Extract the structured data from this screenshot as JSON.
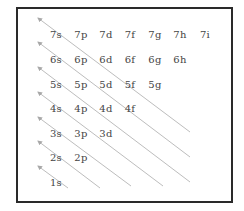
{
  "diagram": {
    "rows": [
      [
        "7s",
        "7p",
        "7d",
        "7f",
        "7g",
        "7h",
        "7i"
      ],
      [
        "6s",
        "6p",
        "6d",
        "6f",
        "6g",
        "6h"
      ],
      [
        "5s",
        "5p",
        "5d",
        "5f",
        "5g"
      ],
      [
        "4s",
        "4p",
        "4d",
        "4f"
      ],
      [
        "3s",
        "3p",
        "3d"
      ],
      [
        "2s",
        "2p"
      ],
      [
        "1s"
      ]
    ],
    "arrow_count": 7,
    "colors": {
      "border": "#2a2a2a",
      "text": "#444444",
      "arrow": "#b8b8b8",
      "background": "#ffffff"
    }
  }
}
